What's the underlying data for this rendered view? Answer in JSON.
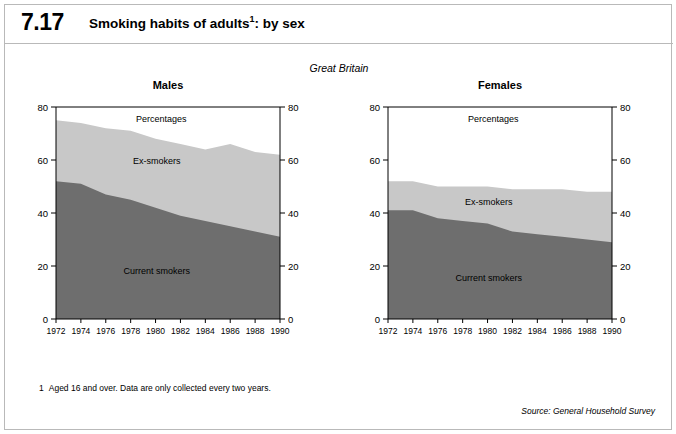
{
  "figure": {
    "number": "7.17",
    "title": "Smoking habits of adults",
    "title_footnote_marker": "1",
    "title_suffix": ": by sex",
    "region": "Great Britain",
    "footnote_number": "1",
    "footnote_text": "Aged 16 and over. Data are only collected every two years.",
    "source": "Source: General Household Survey"
  },
  "colors": {
    "current_smokers": "#6e6e6e",
    "ex_smokers": "#c8c8c8",
    "axis": "#000000",
    "border": "#b9b9b9",
    "background": "#ffffff"
  },
  "chart_data": [
    {
      "type": "area",
      "title": "Males",
      "subtitle": "Percentages",
      "xlabel": "",
      "ylabel": "Percentages",
      "ylim": [
        0,
        80
      ],
      "yticks": [
        0,
        20,
        40,
        60,
        80
      ],
      "grid": false,
      "stacked": true,
      "legend": "in-plot labels",
      "categories": [
        1972,
        1974,
        1976,
        1978,
        1980,
        1982,
        1984,
        1986,
        1988,
        1990
      ],
      "series": [
        {
          "name": "Current smokers",
          "values": [
            52,
            51,
            47,
            45,
            42,
            39,
            37,
            35,
            33,
            31
          ]
        },
        {
          "name": "Ex-smokers",
          "values": [
            23,
            23,
            25,
            26,
            26,
            27,
            27,
            31,
            30,
            31
          ]
        }
      ],
      "totals": [
        75,
        74,
        72,
        71,
        68,
        66,
        64,
        66,
        63,
        62
      ]
    },
    {
      "type": "area",
      "title": "Females",
      "subtitle": "Percentages",
      "xlabel": "",
      "ylabel": "Percentages",
      "ylim": [
        0,
        80
      ],
      "yticks": [
        0,
        20,
        40,
        60,
        80
      ],
      "grid": false,
      "stacked": true,
      "legend": "in-plot labels",
      "categories": [
        1972,
        1974,
        1976,
        1978,
        1980,
        1982,
        1984,
        1986,
        1988,
        1990
      ],
      "series": [
        {
          "name": "Current smokers",
          "values": [
            41,
            41,
            38,
            37,
            36,
            33,
            32,
            31,
            30,
            29
          ]
        },
        {
          "name": "Ex-smokers",
          "values": [
            11,
            11,
            12,
            13,
            14,
            16,
            17,
            18,
            18,
            19
          ]
        }
      ],
      "totals": [
        52,
        52,
        50,
        50,
        50,
        49,
        49,
        49,
        48,
        48
      ]
    }
  ],
  "panels": {
    "males": {
      "title": "Males",
      "percentages_label": "Percentages",
      "ex_smokers_label": "Ex-smokers",
      "current_smokers_label": "Current smokers",
      "y_axis_left": [
        "80",
        "60",
        "40",
        "20",
        "0"
      ],
      "y_axis_right": [
        "80",
        "60",
        "40",
        "20",
        "0"
      ],
      "x_axis": [
        "1972",
        "1974",
        "1976",
        "1978",
        "1980",
        "1982",
        "1984",
        "1986",
        "1988",
        "1990"
      ]
    },
    "females": {
      "title": "Females",
      "percentages_label": "Percentages",
      "ex_smokers_label": "Ex-smokers",
      "current_smokers_label": "Current smokers",
      "y_axis_left": [
        "80",
        "60",
        "40",
        "20",
        "0"
      ],
      "y_axis_right": [
        "80",
        "60",
        "40",
        "20",
        "0"
      ],
      "x_axis": [
        "1972",
        "1974",
        "1976",
        "1978",
        "1980",
        "1982",
        "1984",
        "1986",
        "1988",
        "1990"
      ]
    }
  }
}
